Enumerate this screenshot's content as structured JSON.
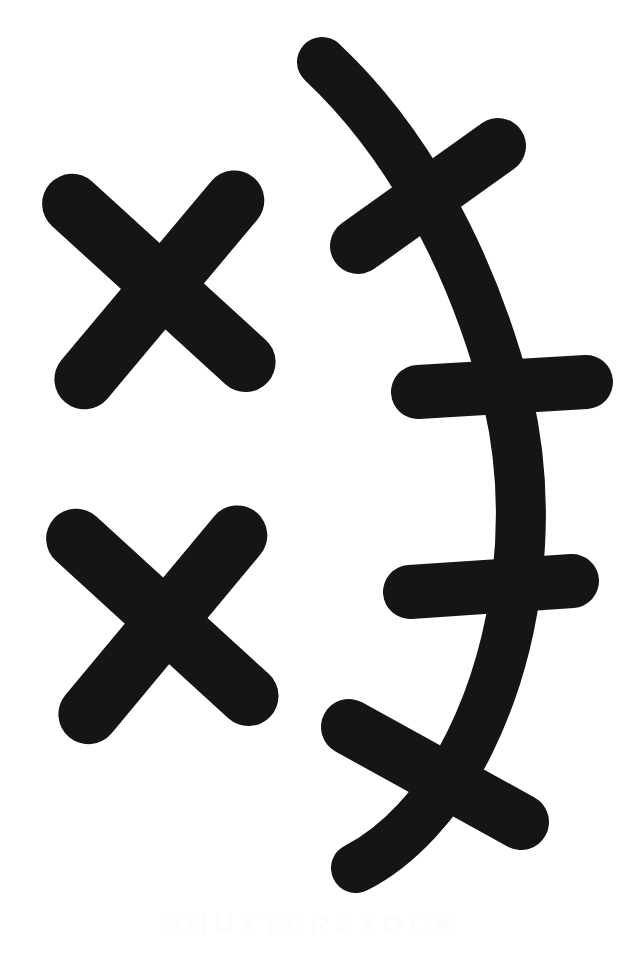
{
  "document": {
    "title": "Scanned page of hand-drawn marks",
    "background_color": "#ffffff",
    "ink_color": "#151515",
    "width": 626,
    "height": 954
  },
  "watermark": {
    "text": "SHUTTERSTOCK",
    "color": "#fcfcfc",
    "visible": true,
    "note": "Very faint, nearly illegible at bottom of page"
  },
  "marks": {
    "group_left": {
      "label": "Two X marks, stacked vertically",
      "items": [
        {
          "name": "x-mark-upper",
          "label": "X mark (upper left)",
          "center": [
            158,
            285
          ],
          "size": 210,
          "stroke_width": 60,
          "rotation_deg": -4
        },
        {
          "name": "x-mark-lower",
          "label": "X mark (lower left)",
          "center": [
            160,
            620
          ],
          "size": 212,
          "stroke_width": 60,
          "rotation_deg": -4
        }
      ]
    },
    "group_right": {
      "label": "Curved vertical stroke crossed by four bars",
      "spine": {
        "name": "curved-spine",
        "label": "Curved vertical stroke",
        "stroke_width": 50,
        "top_point": [
          322,
          62
        ],
        "bottom_point": [
          356,
          868
        ],
        "rightmost_x": 528
      },
      "crossbars": [
        {
          "name": "crossbar-1",
          "label": "Crossbar 1 (tilted up to the right)",
          "from": [
            358,
            246
          ],
          "to": [
            498,
            146
          ],
          "stroke_width": 56
        },
        {
          "name": "crossbar-2",
          "label": "Crossbar 2 (near horizontal)",
          "from": [
            418,
            392
          ],
          "to": [
            586,
            382
          ],
          "stroke_width": 54
        },
        {
          "name": "crossbar-3",
          "label": "Crossbar 3 (near horizontal)",
          "from": [
            410,
            592
          ],
          "to": [
            572,
            581
          ],
          "stroke_width": 54
        },
        {
          "name": "crossbar-4",
          "label": "Crossbar 4 (tilted down to the right)",
          "from": [
            349,
            727
          ],
          "to": [
            521,
            822
          ],
          "stroke_width": 56
        }
      ]
    }
  },
  "chart_data": {
    "type": "scatter",
    "xlabel": "x (px)",
    "ylabel": "y (px)",
    "xlim": [
      0,
      626
    ],
    "ylim": [
      0,
      954
    ],
    "categories": [
      "x-mark-upper",
      "x-mark-lower",
      "curved-spine",
      "crossbar-1",
      "crossbar-2",
      "crossbar-3",
      "crossbar-4"
    ],
    "x": [
      158,
      160,
      425,
      428,
      502,
      491,
      435
    ],
    "y": [
      285,
      620,
      465,
      196,
      387,
      586,
      774
    ]
  }
}
